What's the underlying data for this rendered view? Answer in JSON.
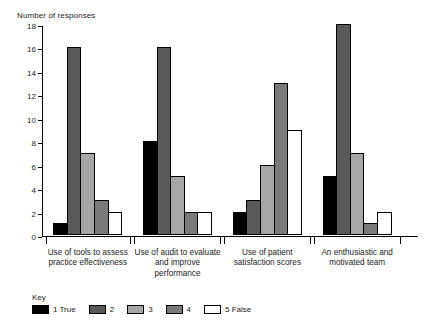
{
  "chart_data": {
    "type": "bar",
    "title": "",
    "ylabel": "Number of responses",
    "xlabel": "",
    "ylim": [
      0,
      18
    ],
    "yticks": [
      0,
      2,
      4,
      6,
      8,
      10,
      12,
      14,
      16,
      18
    ],
    "grid": false,
    "legend_position": "bottom-left",
    "legend_title": "Key",
    "categories": [
      "Use of tools to assess practice effectiveness",
      "Use of audit to evaluate and improve performance",
      "Use of patient satisfaction scores",
      "An enthusiastic and motivated team"
    ],
    "series": [
      {
        "name": "1 True",
        "color": "#000000",
        "values": [
          1,
          8,
          2,
          5
        ]
      },
      {
        "name": "2",
        "color": "#595959",
        "values": [
          16,
          16,
          3,
          18
        ]
      },
      {
        "name": "3",
        "color": "#a6a6a6",
        "values": [
          7,
          5,
          6,
          7
        ]
      },
      {
        "name": "4",
        "color": "#7a7a7a",
        "values": [
          3,
          2,
          13,
          1
        ]
      },
      {
        "name": "5 False",
        "color": "#ffffff",
        "values": [
          2,
          2,
          9,
          2
        ]
      }
    ]
  }
}
